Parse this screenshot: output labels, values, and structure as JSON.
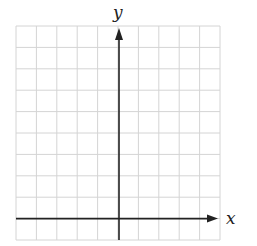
{
  "diagram": {
    "type": "coordinate-grid",
    "grid": {
      "columns": 10,
      "rows": 10,
      "line_color": "#d4d4d4",
      "left": 16,
      "right": 220,
      "top": 26,
      "bottom": 240
    },
    "axes": {
      "x_label": "x",
      "y_label": "y",
      "color": "#222222",
      "x_axis_row_from_top": 9,
      "y_axis_col_from_left": 5
    }
  }
}
